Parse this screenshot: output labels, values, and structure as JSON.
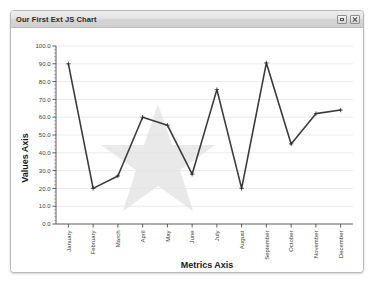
{
  "window": {
    "title": "Our First Ext JS Chart",
    "controls": [
      {
        "name": "restore-button",
        "glyph": "restore"
      },
      {
        "name": "close-button",
        "glyph": "close"
      }
    ]
  },
  "chart_data": {
    "type": "line",
    "title": "",
    "xlabel": "Metrics Axis",
    "ylabel": "Values Axis",
    "categories": [
      "January",
      "February",
      "March",
      "April",
      "May",
      "June",
      "July",
      "August",
      "September",
      "October",
      "November",
      "December"
    ],
    "values": [
      90,
      20,
      27,
      60,
      55.5,
      28,
      75.5,
      20,
      90.5,
      45,
      62,
      64
    ],
    "series": [
      {
        "name": "Values",
        "values": [
          90,
          20,
          27,
          60,
          55.5,
          28,
          75.5,
          20,
          90.5,
          45,
          62,
          64
        ]
      }
    ],
    "ylim": [
      0,
      100
    ],
    "y_ticks": [
      "0.0",
      "10.0",
      "20.0",
      "30.0",
      "40.0",
      "50.0",
      "60.0",
      "70.0",
      "80.0",
      "90.0",
      "100.0"
    ],
    "y_tick_step": 10,
    "y_minor_step": 2,
    "grid": true,
    "legend": "none",
    "marker": "cross",
    "line_color": "#3b3b3b",
    "grid_color": "#dfe3e6",
    "background_watermark": "star-shape"
  }
}
